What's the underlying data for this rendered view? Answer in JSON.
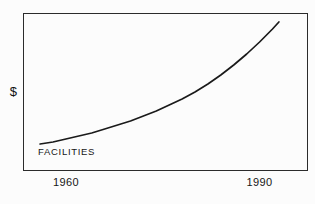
{
  "colors": {
    "background": "#fcfcfc",
    "frame": "#2b2b2b",
    "line": "#1a1a1a",
    "text": "#111111"
  },
  "chart_data": {
    "type": "line",
    "title": "",
    "xlabel": "",
    "ylabel": "$",
    "y_units": "unlabeled (relative dollar scale)",
    "grid": false,
    "legend_position": "none (series labeled inline inside plot)",
    "xticks": [
      1960,
      1990
    ],
    "xlim": [
      1953.35,
      1997.35
    ],
    "ylim": [
      0,
      157
    ],
    "x": [
      1956,
      1958,
      1960,
      1962,
      1964,
      1966,
      1968,
      1970,
      1972,
      1974,
      1976,
      1978,
      1980,
      1982,
      1984,
      1986,
      1988,
      1990,
      1992,
      1993
    ],
    "series": [
      {
        "name": "FACILITIES",
        "color": "#1a1a1a",
        "values": [
          26,
          28,
          31,
          34,
          37,
          41,
          45,
          49,
          54,
          59,
          65,
          71,
          78,
          86,
          95,
          105,
          116,
          128,
          141,
          148
        ]
      }
    ]
  }
}
